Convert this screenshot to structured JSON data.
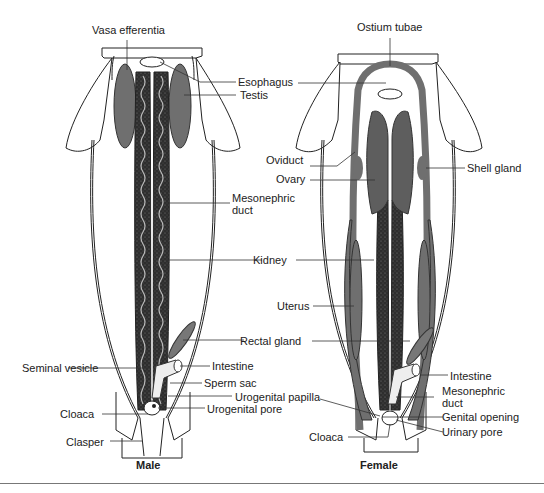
{
  "figure": {
    "panels": [
      {
        "caption": "Male",
        "labels": {
          "vasa_efferentia": "Vasa efferentia",
          "esophagus": "Esophagus",
          "testis": "Testis",
          "mesonephric_duct_1": "Mesonephric",
          "mesonephric_duct_2": "duct",
          "kidney": "Kidney",
          "rectal_gland": "Rectal gland",
          "seminal_vesicle": "Seminal vesicle",
          "intestine": "Intestine",
          "sperm_sac": "Sperm sac",
          "urogenital_papilla": "Urogenital papilla",
          "urogenital_pore": "Urogenital pore",
          "cloaca": "Cloaca",
          "clasper": "Clasper"
        }
      },
      {
        "caption": "Female",
        "labels": {
          "ostium_tubae": "Ostium tubae",
          "oviduct": "Oviduct",
          "ovary": "Ovary",
          "shell_gland": "Shell gland",
          "uterus": "Uterus",
          "intestine": "Intestine",
          "mesonephric_duct_1": "Mesonephric",
          "mesonephric_duct_2": "duct",
          "genital_opening": "Genital opening",
          "urinary_pore": "Urinary pore",
          "cloaca": "Cloaca"
        }
      }
    ],
    "colors": {
      "organ_gray": "#6f6f6f",
      "kidney_dark": "#2e2e2e",
      "outline": "#222222"
    }
  }
}
